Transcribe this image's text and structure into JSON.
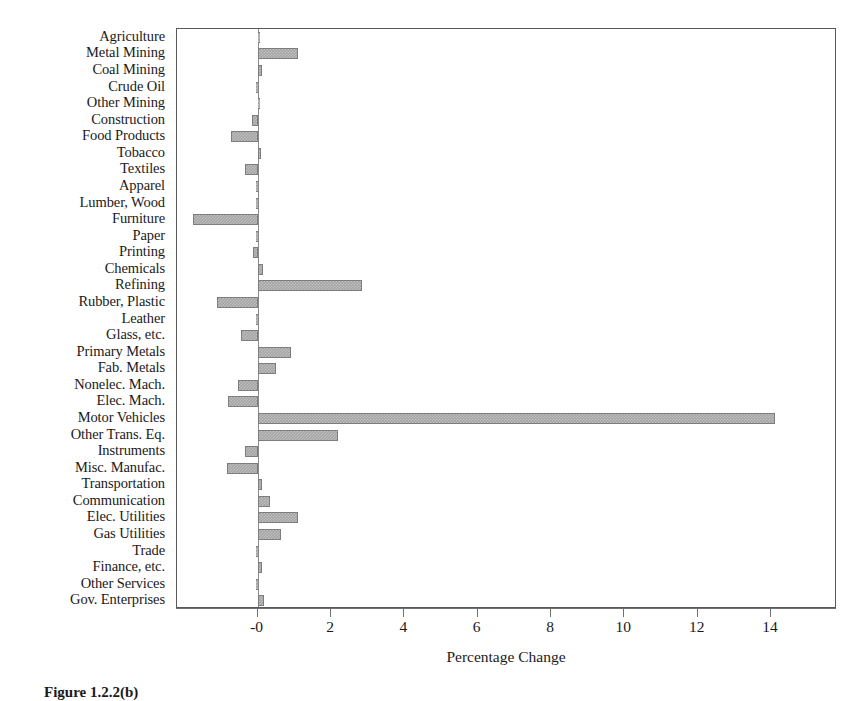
{
  "figure": {
    "caption": "Figure 1.2.2(b)"
  },
  "chart_data": {
    "type": "bar",
    "orientation": "horizontal",
    "title": "",
    "subtitle": "",
    "xlabel": "Percentage Change",
    "ylabel": "",
    "xlim": [
      -2.2,
      15.8
    ],
    "xticks": [
      0,
      2,
      4,
      6,
      8,
      10,
      12,
      14
    ],
    "xtick_labels": [
      "-0",
      "2",
      "4",
      "6",
      "8",
      "10",
      "12",
      "14"
    ],
    "grid": false,
    "legend": null,
    "bar_color": "#a5a5a5",
    "bar_edge_color": "#7d7d7d",
    "zero_line_color": "#8a8a8a",
    "categories": [
      "Agriculture",
      "Metal Mining",
      "Coal Mining",
      "Crude Oil",
      "Other Mining",
      "Construction",
      "Food Products",
      "Tobacco",
      "Textiles",
      "Apparel",
      "Lumber, Wood",
      "Furniture",
      "Paper",
      "Printing",
      "Chemicals",
      "Refining",
      "Rubber, Plastic",
      "Leather",
      "Glass, etc.",
      "Primary Metals",
      "Fab. Metals",
      "Nonelec. Mach.",
      "Elec. Mach.",
      "Motor Vehicles",
      "Other Trans. Eq.",
      "Instruments",
      "Misc. Manufac.",
      "Transportation",
      "Communication",
      "Elec. Utilities",
      "Gas Utilities",
      "Trade",
      "Finance, etc.",
      "Other Services",
      "Gov. Enterprises"
    ],
    "values": [
      0.02,
      1.1,
      0.12,
      -0.05,
      0.05,
      -0.15,
      -0.72,
      0.08,
      -0.35,
      -0.02,
      -0.05,
      -1.77,
      -0.05,
      -0.12,
      0.15,
      2.85,
      -1.1,
      -0.04,
      -0.45,
      0.9,
      0.5,
      -0.55,
      -0.8,
      14.1,
      2.2,
      -0.35,
      -0.85,
      0.12,
      0.35,
      1.1,
      0.65,
      -0.02,
      0.13,
      -0.03,
      0.18
    ]
  }
}
